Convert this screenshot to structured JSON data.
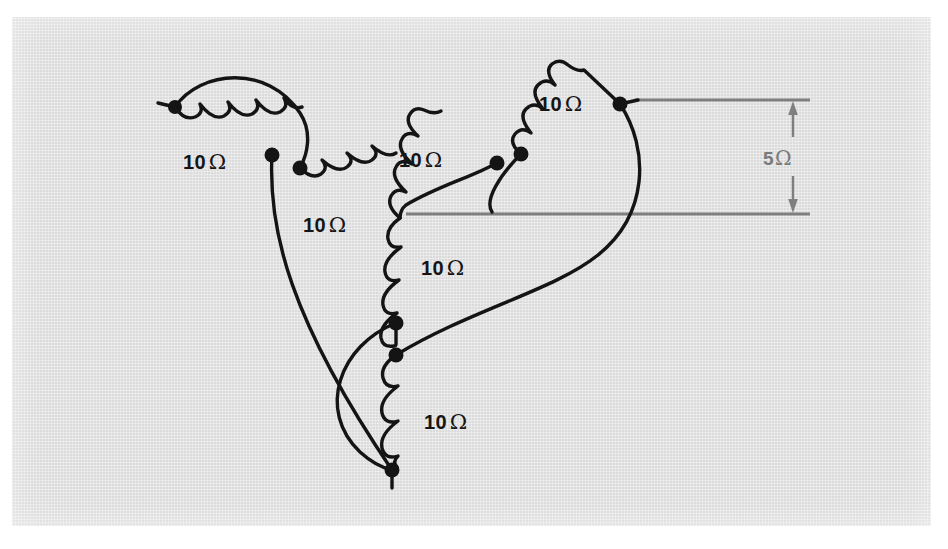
{
  "figure": {
    "kind": "circuit-diagram",
    "background_color": "#e3e3e3",
    "wire_color": "#141414",
    "dimension_color": "#7f7f7f",
    "unit_symbol": "Ω"
  },
  "resistor_labels": [
    {
      "id": "r-upper-left",
      "value": "10",
      "unit": "Ω",
      "x": 183,
      "y": 152
    },
    {
      "id": "r-left-inner",
      "value": "10",
      "unit": "Ω",
      "x": 303,
      "y": 215
    },
    {
      "id": "r-upper-middle",
      "value": "10",
      "unit": "Ω",
      "x": 399,
      "y": 150
    },
    {
      "id": "r-upper-right",
      "value": "10",
      "unit": "Ω",
      "x": 539,
      "y": 94
    },
    {
      "id": "r-center-vertical",
      "value": "10",
      "unit": "Ω",
      "x": 421,
      "y": 258
    },
    {
      "id": "r-bottom",
      "value": "10",
      "unit": "Ω",
      "x": 424,
      "y": 412
    }
  ],
  "dimension": {
    "id": "gap-dimension",
    "value": "5",
    "unit": "Ω",
    "label_x": 763,
    "label_y": 148,
    "upper_line": {
      "x1": 635,
      "y": 100,
      "x2": 810
    },
    "lower_line": {
      "x1": 406,
      "y": 214,
      "x2": 810
    },
    "arrow_x": 793
  },
  "nodes": [
    {
      "id": "terminal-upper-left",
      "x": 175,
      "y": 107
    },
    {
      "id": "node-ul-inner",
      "x": 272,
      "y": 155
    },
    {
      "id": "node-ul-arc-end",
      "x": 300,
      "y": 168
    },
    {
      "id": "node-center-upper",
      "x": 497,
      "y": 163
    },
    {
      "id": "node-right-inner",
      "x": 521,
      "y": 154
    },
    {
      "id": "terminal-right",
      "x": 620,
      "y": 104
    },
    {
      "id": "node-center-lower",
      "x": 396,
      "y": 323
    },
    {
      "id": "node-bottom-upper",
      "x": 396,
      "y": 355
    },
    {
      "id": "terminal-bottom",
      "x": 392,
      "y": 470
    }
  ]
}
